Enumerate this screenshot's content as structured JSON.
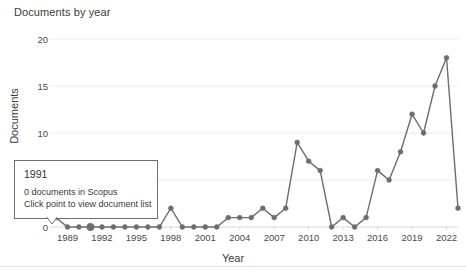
{
  "chart_data": {
    "type": "line",
    "title": "Documents by year",
    "xlabel": "Year",
    "ylabel": "Documents",
    "xlim": [
      1988,
      2023
    ],
    "ylim": [
      0,
      20
    ],
    "grid": true,
    "legend": null,
    "yticks": [
      0,
      5,
      10,
      15,
      20
    ],
    "xticks": [
      1989,
      1992,
      1995,
      1998,
      2001,
      2004,
      2007,
      2010,
      2013,
      2016,
      2019,
      2022
    ],
    "x": [
      1988,
      1989,
      1990,
      1991,
      1992,
      1993,
      1994,
      1995,
      1996,
      1997,
      1998,
      1999,
      2000,
      2001,
      2002,
      2003,
      2004,
      2005,
      2006,
      2007,
      2008,
      2009,
      2010,
      2011,
      2012,
      2013,
      2014,
      2015,
      2016,
      2017,
      2018,
      2019,
      2020,
      2021,
      2022,
      2023
    ],
    "values": [
      1,
      0,
      0,
      0,
      0,
      0,
      0,
      0,
      0,
      0,
      2,
      0,
      0,
      0,
      0,
      1,
      1,
      1,
      2,
      1,
      2,
      9,
      7,
      6,
      0,
      1,
      0,
      1,
      6,
      5,
      8,
      12,
      10,
      15,
      18,
      2
    ],
    "series_name": "Documents",
    "line_color": "#6d6d6d",
    "marker_color": "#6d6d6d",
    "grid_color": "#ececec",
    "axis_color": "#d8d8d8"
  },
  "tooltip": {
    "title": "1991",
    "line1": "0 documents in Scopus",
    "line2": "Click point to view document list"
  }
}
